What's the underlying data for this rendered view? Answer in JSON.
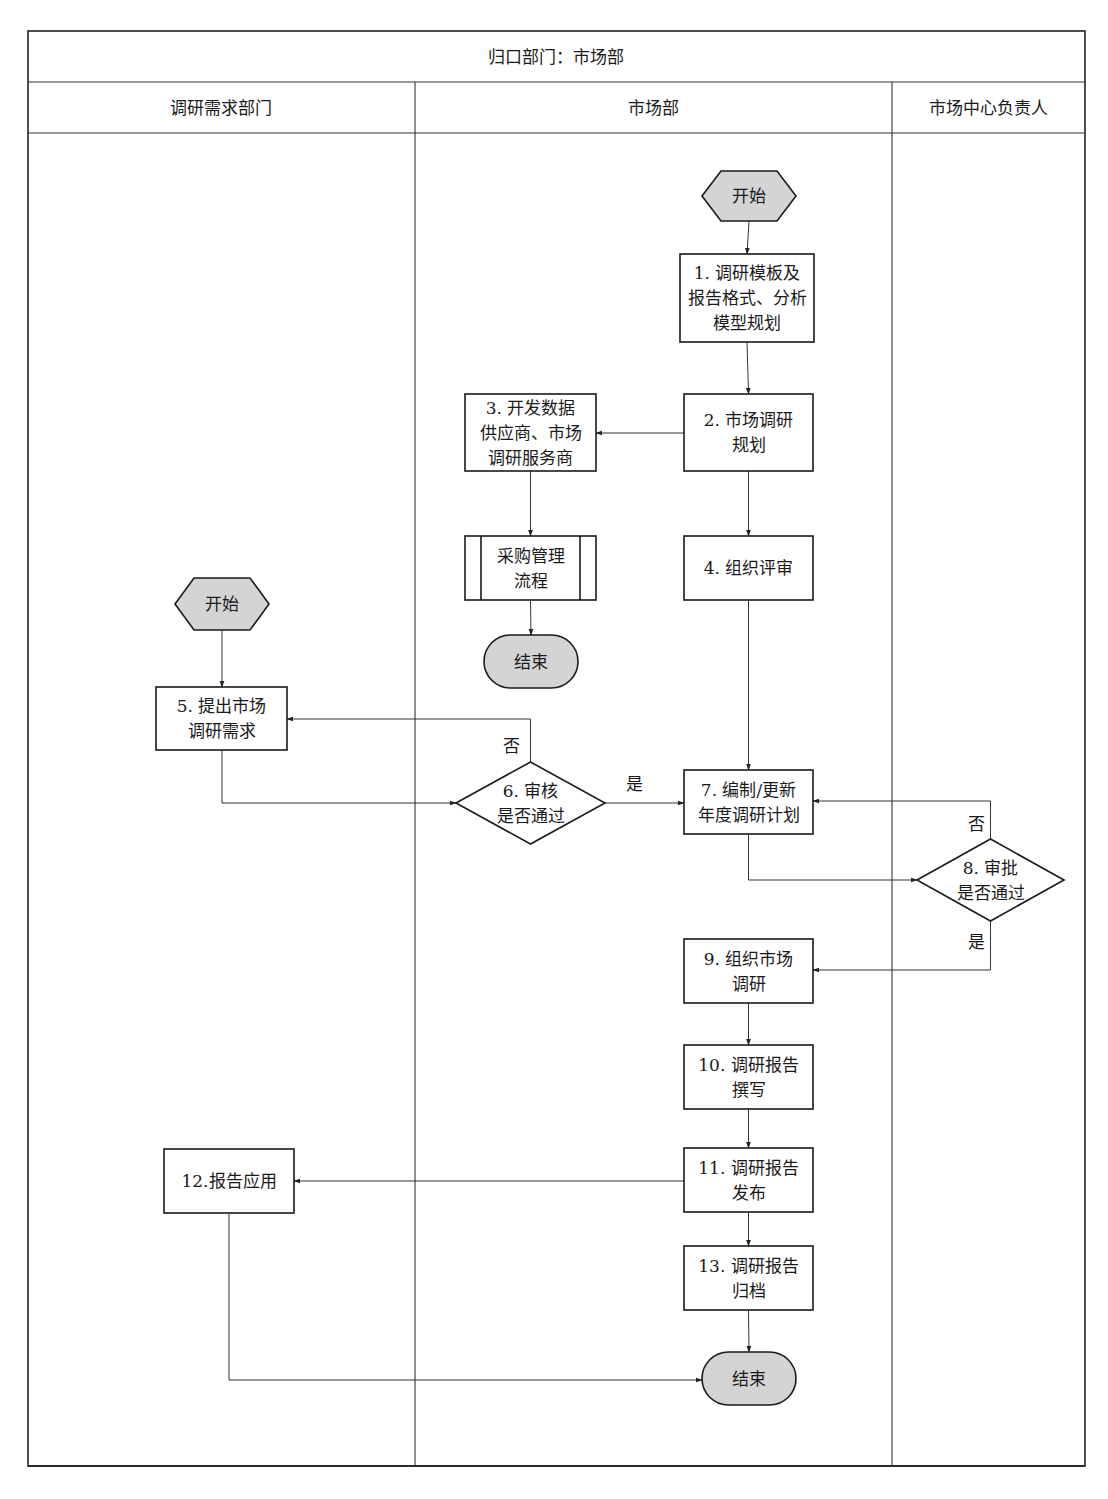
{
  "header": {
    "owner_title": "归口部门：市场部",
    "lanes": [
      {
        "id": "demand",
        "label": "调研需求部门"
      },
      {
        "id": "market",
        "label": "市场部"
      },
      {
        "id": "head",
        "label": "市场中心负责人"
      }
    ]
  },
  "nodes": {
    "start_market": {
      "type": "start",
      "lane": "市场部",
      "lines": [
        "开始"
      ]
    },
    "n1": {
      "type": "process",
      "lane": "市场部",
      "lines": [
        "1. 调研模板及",
        "报告格式、分析",
        "模型规划"
      ]
    },
    "n2": {
      "type": "process",
      "lane": "市场部",
      "lines": [
        "2. 市场调研",
        "规划"
      ]
    },
    "n3": {
      "type": "process",
      "lane": "市场部",
      "lines": [
        "3. 开发数据",
        "供应商、市场",
        "调研服务商"
      ]
    },
    "procurement": {
      "type": "subprocess",
      "lane": "市场部",
      "lines": [
        "采购管理",
        "流程"
      ]
    },
    "end_procurement": {
      "type": "end",
      "lane": "市场部",
      "lines": [
        "结束"
      ]
    },
    "n4": {
      "type": "process",
      "lane": "市场部",
      "lines": [
        "4. 组织评审"
      ]
    },
    "start_demand": {
      "type": "start",
      "lane": "调研需求部门",
      "lines": [
        "开始"
      ]
    },
    "n5": {
      "type": "process",
      "lane": "调研需求部门",
      "lines": [
        "5. 提出市场",
        "调研需求"
      ]
    },
    "n6": {
      "type": "decision",
      "lane": "市场部",
      "lines": [
        "6. 审核",
        "是否通过"
      ]
    },
    "n7": {
      "type": "process",
      "lane": "市场部",
      "lines": [
        "7. 编制/更新",
        "年度调研计划"
      ]
    },
    "n8": {
      "type": "decision",
      "lane": "市场中心负责人",
      "lines": [
        "8. 审批",
        "是否通过"
      ]
    },
    "n9": {
      "type": "process",
      "lane": "市场部",
      "lines": [
        "9. 组织市场",
        "调研"
      ]
    },
    "n10": {
      "type": "process",
      "lane": "市场部",
      "lines": [
        "10. 调研报告",
        "撰写"
      ]
    },
    "n11": {
      "type": "process",
      "lane": "市场部",
      "lines": [
        "11. 调研报告",
        "发布"
      ]
    },
    "n12": {
      "type": "process",
      "lane": "调研需求部门",
      "lines": [
        "12.报告应用"
      ]
    },
    "n13": {
      "type": "process",
      "lane": "市场部",
      "lines": [
        "13. 调研报告",
        "归档"
      ]
    },
    "end_main": {
      "type": "end",
      "lane": "市场部",
      "lines": [
        "结束"
      ]
    }
  },
  "edges": [
    {
      "id": "e1",
      "from": "start_market",
      "to": "n1",
      "label": ""
    },
    {
      "id": "e2",
      "from": "n1",
      "to": "n2",
      "label": ""
    },
    {
      "id": "e3",
      "from": "n2",
      "to": "n3",
      "label": ""
    },
    {
      "id": "e4",
      "from": "n3",
      "to": "procurement",
      "label": ""
    },
    {
      "id": "e5",
      "from": "procurement",
      "to": "end_procurement",
      "label": ""
    },
    {
      "id": "e6",
      "from": "n2",
      "to": "n4",
      "label": ""
    },
    {
      "id": "e7",
      "from": "n4",
      "to": "n7",
      "label": ""
    },
    {
      "id": "e8",
      "from": "start_demand",
      "to": "n5",
      "label": ""
    },
    {
      "id": "e9",
      "from": "n5",
      "to": "n6",
      "label": ""
    },
    {
      "id": "e10",
      "from": "n6",
      "to": "n5",
      "label": "否"
    },
    {
      "id": "e11",
      "from": "n6",
      "to": "n7",
      "label": "是"
    },
    {
      "id": "e12",
      "from": "n7",
      "to": "n8",
      "label": ""
    },
    {
      "id": "e13",
      "from": "n8",
      "to": "n7",
      "label": "否"
    },
    {
      "id": "e14",
      "from": "n8",
      "to": "n9",
      "label": "是"
    },
    {
      "id": "e15",
      "from": "n9",
      "to": "n10",
      "label": ""
    },
    {
      "id": "e16",
      "from": "n10",
      "to": "n11",
      "label": ""
    },
    {
      "id": "e17",
      "from": "n11",
      "to": "n12",
      "label": ""
    },
    {
      "id": "e18",
      "from": "n11",
      "to": "n13",
      "label": ""
    },
    {
      "id": "e19",
      "from": "n13",
      "to": "end_main",
      "label": ""
    },
    {
      "id": "e20",
      "from": "n12",
      "to": "end_main",
      "label": ""
    }
  ]
}
